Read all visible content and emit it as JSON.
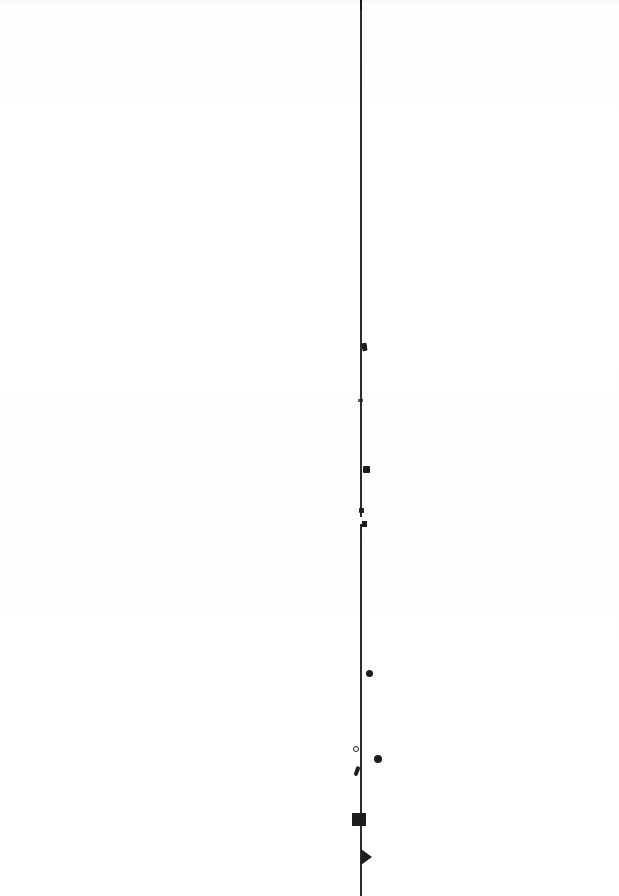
{
  "page": {
    "width": 619,
    "height": 896,
    "background_color": "#ffffff",
    "ink_color": "#1d1d1d",
    "rule_color": "#2b2b2b",
    "visible_text": "",
    "note": ""
  },
  "rule": {
    "name": "vertical-rule",
    "x": 360,
    "thickness": 1.6,
    "segments": [
      {
        "label": "upper-segment",
        "top": 0,
        "height": 517
      },
      {
        "label": "lower-segment",
        "top": 524,
        "height": 372
      }
    ],
    "break": {
      "label": "rule-gap",
      "top": 517,
      "height": 7
    }
  },
  "marks": [
    {
      "name": "mark-blob",
      "shape": "blob",
      "x": 362,
      "y": 343
    },
    {
      "name": "mark-tick",
      "shape": "tick",
      "x": 358,
      "y": 399
    },
    {
      "name": "mark-square-upper",
      "shape": "square",
      "x": 363,
      "y": 466
    },
    {
      "name": "mark-square-gap-a",
      "shape": "square",
      "x": 359,
      "y": 508
    },
    {
      "name": "mark-square-gap-b",
      "shape": "square",
      "x": 362,
      "y": 521
    },
    {
      "name": "mark-dot-mid",
      "shape": "dot",
      "x": 366,
      "y": 670
    },
    {
      "name": "mark-ring",
      "shape": "ring",
      "x": 353,
      "y": 746
    },
    {
      "name": "mark-dot-right",
      "shape": "dot",
      "x": 374,
      "y": 755
    },
    {
      "name": "mark-slash",
      "shape": "slash",
      "x": 355,
      "y": 766
    },
    {
      "name": "mark-block",
      "shape": "rectangle",
      "x": 352,
      "y": 813
    },
    {
      "name": "mark-arrowhead",
      "shape": "triangle",
      "x": 361,
      "y": 849
    }
  ]
}
